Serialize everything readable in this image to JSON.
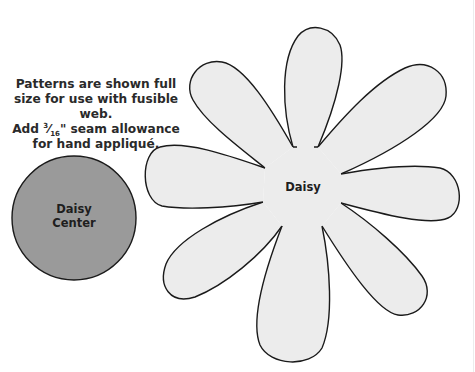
{
  "instructions": {
    "line1": "Patterns are shown full",
    "line2": "size for use with fusible web.",
    "line3_prefix": "Add ",
    "fraction_num": "3",
    "fraction_den": "16",
    "line3_suffix": "\" seam allowance",
    "line4": "for hand appliqué."
  },
  "shapes": {
    "center": {
      "label_line1": "Daisy",
      "label_line2": "Center",
      "fill": "#9a9a9a",
      "stroke": "#1a1a1a"
    },
    "daisy": {
      "label": "Daisy",
      "petal_count": 8,
      "fill": "#ececec",
      "stroke": "#1a1a1a"
    }
  },
  "colors": {
    "background": "#ffffff",
    "text": "#2a2a2a"
  }
}
